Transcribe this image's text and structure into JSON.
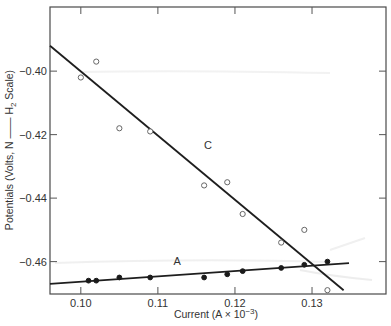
{
  "chart_data": {
    "type": "scatter",
    "title": "",
    "xlabel": "Current (A × 10⁻³)",
    "ylabel": "Potentials (Volts, N —— H₂ Scale)",
    "xlim": [
      0.096,
      0.1396
    ],
    "ylim": [
      -0.4702,
      -0.3798
    ],
    "x_ticks": [
      0.1,
      0.11,
      0.12,
      0.13
    ],
    "x_tick_labels": [
      "0.10",
      "0.11",
      "0.12",
      "0.13"
    ],
    "y_ticks": [
      -0.4,
      -0.42,
      -0.44,
      -0.46
    ],
    "y_tick_labels": [
      "−0.40",
      "−0.42",
      "−0.44",
      "−0.46"
    ],
    "grid": false,
    "legend": "none (series labeled inline)",
    "series": [
      {
        "name": "C",
        "marker": "open-circle",
        "points": [
          {
            "x": 0.1,
            "y": -0.402
          },
          {
            "x": 0.102,
            "y": -0.397
          },
          {
            "x": 0.105,
            "y": -0.418
          },
          {
            "x": 0.109,
            "y": -0.419
          },
          {
            "x": 0.116,
            "y": -0.436
          },
          {
            "x": 0.119,
            "y": -0.435
          },
          {
            "x": 0.121,
            "y": -0.445
          },
          {
            "x": 0.126,
            "y": -0.454
          },
          {
            "x": 0.129,
            "y": -0.45
          },
          {
            "x": 0.132,
            "y": -0.469
          }
        ],
        "fit_line": {
          "x0": 0.096,
          "y0": -0.392,
          "x1": 0.1341,
          "y1": -0.469
        },
        "label_pos": {
          "x": 0.1165,
          "y": -0.4245
        }
      },
      {
        "name": "A",
        "marker": "filled-circle",
        "points": [
          {
            "x": 0.101,
            "y": -0.466
          },
          {
            "x": 0.102,
            "y": -0.466
          },
          {
            "x": 0.105,
            "y": -0.465
          },
          {
            "x": 0.109,
            "y": -0.465
          },
          {
            "x": 0.116,
            "y": -0.465
          },
          {
            "x": 0.119,
            "y": -0.464
          },
          {
            "x": 0.121,
            "y": -0.463
          },
          {
            "x": 0.126,
            "y": -0.462
          },
          {
            "x": 0.129,
            "y": -0.461
          },
          {
            "x": 0.132,
            "y": -0.46
          }
        ],
        "fit_line": {
          "x0": 0.096,
          "y0": -0.467,
          "x1": 0.1348,
          "y1": -0.4605
        },
        "label_pos": {
          "x": 0.1125,
          "y": -0.4612
        }
      }
    ]
  },
  "axes": {
    "x_title": "Current (A × 10",
    "x_title_sup": "−3",
    "x_title_end": ")",
    "y_title_main": "Potentials (Volts, N —— H",
    "y_title_sub": "2",
    "y_title_end": " Scale)"
  },
  "colors": {
    "axis": "#4a4a4a",
    "line": "#1e1e1e",
    "open_marker_stroke": "#666666",
    "filled_marker": "#1a1a1a"
  }
}
